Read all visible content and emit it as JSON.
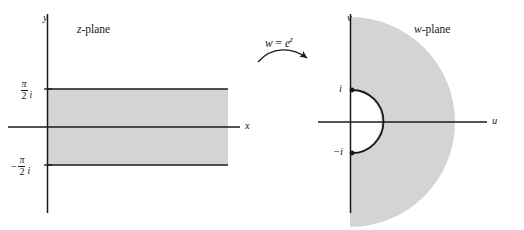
{
  "figure": {
    "background_color": "#ffffff",
    "shade_color": "#d4d4d4",
    "stroke_color": "#1a1a1a"
  },
  "mapping": {
    "label_w": "w",
    "label_equals": "=",
    "label_e": "e",
    "label_exponent": "z",
    "arrow": "curved-arrow-right"
  },
  "z_plane": {
    "title_var": "z",
    "title_suffix": "-plane",
    "x_axis_label": "x",
    "y_axis_label": "y",
    "upper_bound": {
      "minus": "",
      "numerator": "π",
      "denominator": "2",
      "imag": "i"
    },
    "lower_bound": {
      "minus": "−",
      "numerator": "π",
      "denominator": "2",
      "imag": "i"
    },
    "region_description": "shaded horizontal strip -π/2 < y < π/2"
  },
  "w_plane": {
    "title_var": "w",
    "title_suffix": "-plane",
    "u_axis_label": "u",
    "v_axis_label": "v",
    "point_upper": "i",
    "point_lower": "−i",
    "region_description": "shaded right half-disk with unit semicircle removed"
  }
}
